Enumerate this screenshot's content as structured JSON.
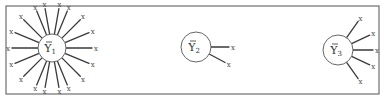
{
  "diagram": {
    "frame": {
      "x": 6,
      "y": 6,
      "width": 373,
      "height": 88,
      "color": "#6e6e6e"
    },
    "observation_label": "x",
    "clusters": [
      {
        "id": "cluster-1",
        "mean_symbol": "Y",
        "subscript": "1",
        "cx": 52,
        "cy": 48,
        "r": 14,
        "spoke_length": 26,
        "angles_deg": [
          0,
          22.5,
          45,
          67.5,
          80,
          100,
          112.5,
          135,
          157.5,
          180,
          202.5,
          225,
          247.5,
          260,
          280,
          292.5,
          315,
          337.5
        ]
      },
      {
        "id": "cluster-2",
        "mean_symbol": "Y",
        "subscript": "2",
        "cx": 196,
        "cy": 47,
        "r": 15,
        "spoke_length": 18,
        "angles_deg": [
          0,
          28
        ]
      },
      {
        "id": "cluster-3",
        "mean_symbol": "Y",
        "subscript": "3",
        "cx": 338,
        "cy": 50,
        "r": 15,
        "spoke_length": 20,
        "angles_deg": [
          -55,
          -25,
          0,
          25,
          55
        ]
      }
    ]
  }
}
